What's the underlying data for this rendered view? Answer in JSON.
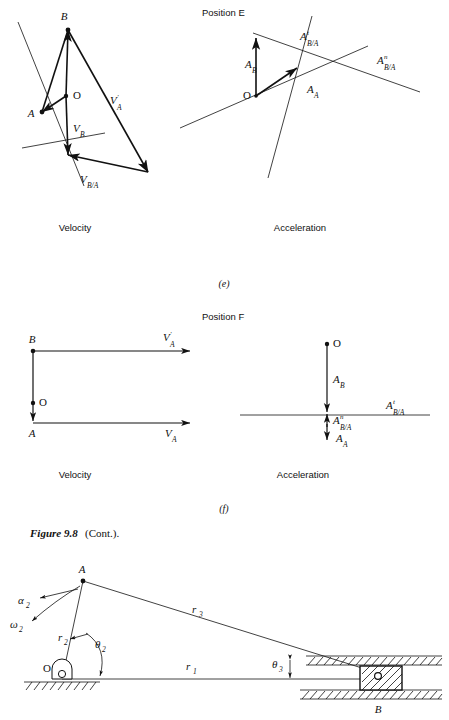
{
  "figure": {
    "caption_bold": "Figure 9.8",
    "caption_rest": "(Cont.)."
  },
  "panels": [
    {
      "id": "e",
      "letter": "(e)",
      "position_label": "Position E",
      "velocity_title": "Velocity",
      "acceleration_title": "Acceleration",
      "velocity_vectors": [
        {
          "name": "V_A_prime",
          "base": "V",
          "sup": "′",
          "sub": "A"
        },
        {
          "name": "V_B",
          "base": "V",
          "sup": "",
          "sub": "B"
        },
        {
          "name": "V_B_over_A",
          "base": "V",
          "sup": "",
          "sub": "B/A"
        }
      ],
      "velocity_points": [
        "B",
        "A",
        "O"
      ],
      "acceleration_vectors": [
        {
          "name": "A_t_B_over_A",
          "base": "A",
          "sup": "t",
          "sub": "B/A"
        },
        {
          "name": "A_n_B_over_A",
          "base": "A",
          "sup": "n",
          "sub": "B/A"
        },
        {
          "name": "A_B",
          "base": "A",
          "sup": "",
          "sub": "B"
        },
        {
          "name": "A_A",
          "base": "A",
          "sup": "",
          "sub": "A"
        }
      ],
      "acceleration_points": [
        "O"
      ]
    },
    {
      "id": "f",
      "letter": "(f)",
      "position_label": "Position F",
      "velocity_title": "Velocity",
      "acceleration_title": "Acceleration",
      "velocity_vectors": [
        {
          "name": "V_A_prime",
          "base": "V",
          "sup": "′",
          "sub": "A"
        },
        {
          "name": "V_A",
          "base": "V",
          "sup": "",
          "sub": "A"
        }
      ],
      "velocity_points": [
        "B",
        "A",
        "O"
      ],
      "acceleration_vectors": [
        {
          "name": "A_B",
          "base": "A",
          "sup": "",
          "sub": "B"
        },
        {
          "name": "A_t_B_over_A",
          "base": "A",
          "sup": "t",
          "sub": "B/A"
        },
        {
          "name": "A_n_B_over_A",
          "base": "A",
          "sup": "n",
          "sub": "B/A"
        },
        {
          "name": "A_A",
          "base": "A",
          "sup": "",
          "sub": "A"
        }
      ],
      "acceleration_points": [
        "O"
      ]
    }
  ],
  "mechanism": {
    "points": {
      "pivot": "O",
      "joint": "A",
      "slider": "B"
    },
    "links": {
      "ground": "r",
      "ground_sub": "1",
      "crank": "r",
      "crank_sub": "2",
      "coupler": "r",
      "coupler_sub": "3"
    },
    "angles": {
      "theta2": "θ",
      "theta2_sub": "2",
      "theta3": "θ",
      "theta3_sub": "3"
    },
    "motion": {
      "alpha2": "α",
      "alpha2_sub": "2",
      "omega2": "ω",
      "omega2_sub": "2"
    }
  },
  "colors": {
    "ink": "#111111",
    "paper": "#ffffff"
  }
}
